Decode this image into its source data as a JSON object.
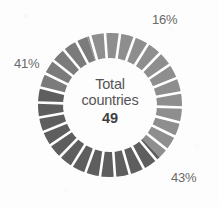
{
  "figure": {
    "background_color": "#fdfdfd",
    "center": {
      "line1": "Total",
      "line2": "countries",
      "value": "49"
    },
    "labels": {
      "top_right": "16%",
      "left": "41%",
      "bottom_right": "43%"
    }
  },
  "chart_data": {
    "type": "pie",
    "variant": "donut",
    "title": "",
    "subtitle": "",
    "xlabel": "",
    "ylabel": "",
    "center_label": "Total countries",
    "center_value": 49,
    "total": 49,
    "grid": false,
    "legend_position": "none",
    "annotations": [
      "16%",
      "41%",
      "43%"
    ],
    "segment_dividers": {
      "count": 30,
      "color": "#ffffff",
      "description": "white radial spokes splitting the ring into thin equal wedges"
    },
    "geometry": {
      "center_x": 110,
      "center_y": 105,
      "outer_radius": 72,
      "inner_radius": 47,
      "start_angle_deg": -76
    },
    "categories": [
      "16%",
      "43%",
      "41%"
    ],
    "values": [
      16,
      43,
      41
    ],
    "labels": [
      "16%",
      "43%",
      "41%"
    ],
    "counts": [
      8,
      21,
      20
    ],
    "colors": [
      "#7b7b7b",
      "#8e8e8e",
      "#5e5e5e"
    ],
    "series": [
      {
        "name": "Share of countries",
        "values": [
          16,
          43,
          41
        ],
        "unit": "%"
      }
    ],
    "slices": [
      {
        "label": "16%",
        "value": 16,
        "color": "#7b7b7b",
        "label_position": "top-right",
        "start_angle_deg": -76,
        "end_angle_deg": -18
      },
      {
        "label": "43%",
        "value": 43,
        "color": "#8e8e8e",
        "label_position": "bottom-right",
        "start_angle_deg": -18,
        "end_angle_deg": 137
      },
      {
        "label": "41%",
        "value": 41,
        "color": "#5e5e5e",
        "label_position": "left",
        "start_angle_deg": 137,
        "end_angle_deg": 284
      }
    ]
  }
}
